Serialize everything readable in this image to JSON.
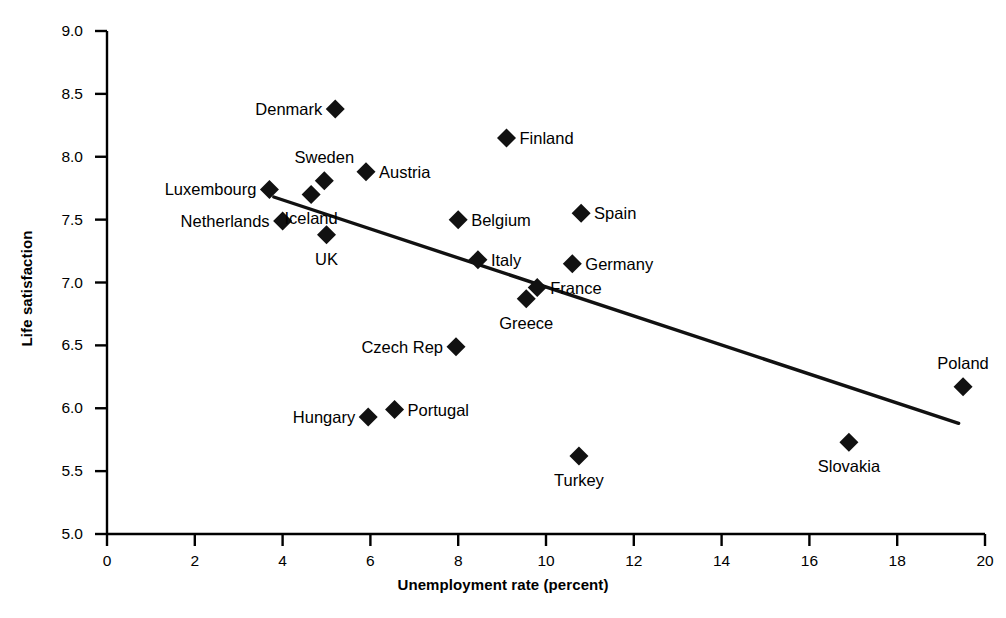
{
  "chart_data": {
    "type": "scatter",
    "title": "",
    "xlabel": "Unemployment rate (percent)",
    "ylabel": "Life satisfaction",
    "xlim": [
      0,
      20
    ],
    "ylim": [
      5.0,
      9.0
    ],
    "xticks": [
      "0",
      "2",
      "4",
      "6",
      "8",
      "10",
      "12",
      "14",
      "16",
      "18",
      "20"
    ],
    "yticks": [
      "5.0",
      "5.5",
      "6.0",
      "6.5",
      "7.0",
      "7.5",
      "8.0",
      "8.5",
      "9.0"
    ],
    "grid": false,
    "legend": "none",
    "marker": "filled-diamond",
    "marker_color": "#111111",
    "points": [
      {
        "label": "Denmark",
        "x": 5.2,
        "y": 8.38,
        "side": "r"
      },
      {
        "label": "Finland",
        "x": 9.1,
        "y": 8.15,
        "side": "l"
      },
      {
        "label": "Austria",
        "x": 5.9,
        "y": 7.88,
        "side": "l"
      },
      {
        "label": "Sweden",
        "x": 4.95,
        "y": 7.81,
        "side": "above"
      },
      {
        "label": "Luxembourg",
        "x": 3.7,
        "y": 7.74,
        "side": "r"
      },
      {
        "label": "Iceland",
        "x": 4.65,
        "y": 7.7,
        "side": "below"
      },
      {
        "label": "Spain",
        "x": 10.8,
        "y": 7.55,
        "side": "l"
      },
      {
        "label": "Netherlands",
        "x": 4.0,
        "y": 7.49,
        "side": "r"
      },
      {
        "label": "Belgium",
        "x": 8.0,
        "y": 7.5,
        "side": "l"
      },
      {
        "label": "UK",
        "x": 5.0,
        "y": 7.38,
        "side": "below"
      },
      {
        "label": "Italy",
        "x": 8.45,
        "y": 7.18,
        "side": "l"
      },
      {
        "label": "Germany",
        "x": 10.6,
        "y": 7.15,
        "side": "l"
      },
      {
        "label": "France",
        "x": 9.8,
        "y": 6.96,
        "side": "l"
      },
      {
        "label": "Greece",
        "x": 9.55,
        "y": 6.87,
        "side": "below"
      },
      {
        "label": "Czech Rep",
        "x": 7.95,
        "y": 6.49,
        "side": "r"
      },
      {
        "label": "Poland",
        "x": 19.5,
        "y": 6.17,
        "side": "above"
      },
      {
        "label": "Portugal",
        "x": 6.55,
        "y": 5.99,
        "side": "l"
      },
      {
        "label": "Hungary",
        "x": 5.95,
        "y": 5.93,
        "side": "r"
      },
      {
        "label": "Slovakia",
        "x": 16.9,
        "y": 5.73,
        "side": "below"
      },
      {
        "label": "Turkey",
        "x": 10.75,
        "y": 5.62,
        "side": "below"
      }
    ],
    "trendline": {
      "x1": 3.8,
      "y1": 7.68,
      "x2": 19.4,
      "y2": 5.88
    }
  },
  "axis": {
    "x_title": "Unemployment rate (percent)",
    "y_title": "Life satisfaction"
  }
}
